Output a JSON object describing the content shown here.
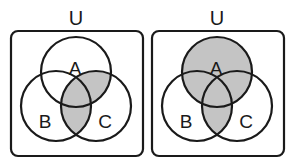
{
  "colors": {
    "stroke": "#1a1a1a",
    "shade": "#c4c4c4",
    "background": "#ffffff"
  },
  "diagrams": [
    {
      "universe_label": "U",
      "set_labels": {
        "a": "A",
        "b": "B",
        "c": "C"
      },
      "shaded_regions": [
        "A∩C only",
        "B∩C only",
        "A∩B∩C"
      ],
      "expression": "(A ∪ B) ∩ C"
    },
    {
      "universe_label": "U",
      "set_labels": {
        "a": "A",
        "b": "B",
        "c": "C"
      },
      "shaded_regions": [
        "A only",
        "A∩B only",
        "A∩C only",
        "A∩B∩C",
        "B∩C only"
      ],
      "expression": "A ∪ (B ∩ C)"
    }
  ]
}
